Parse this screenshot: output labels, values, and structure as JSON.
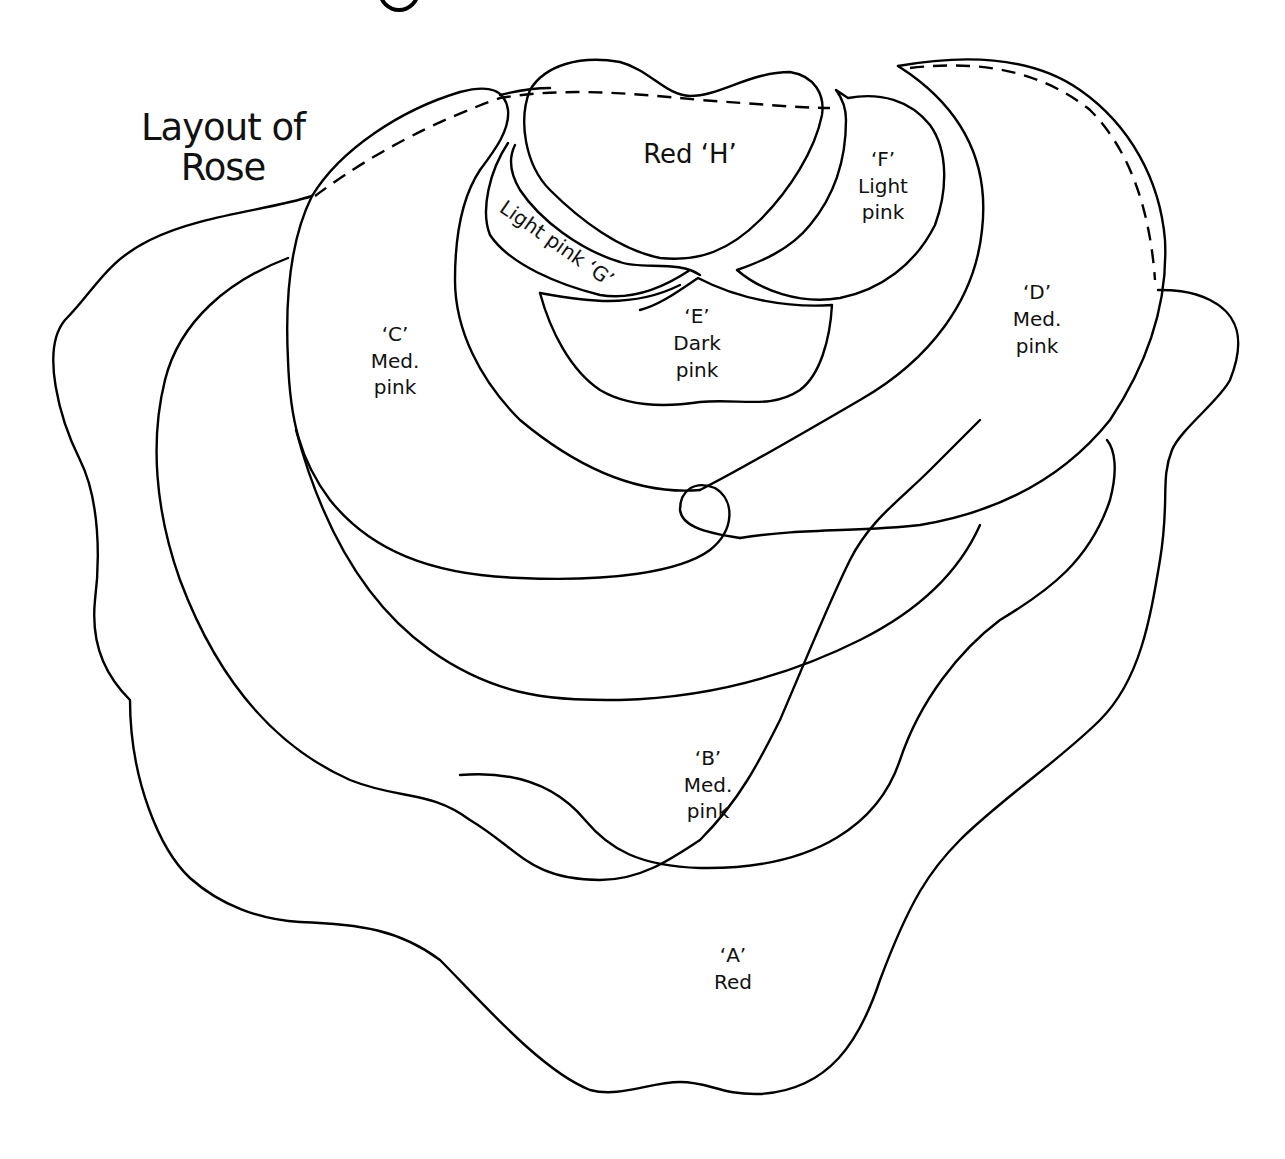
{
  "title": {
    "line1": "Layout of",
    "line2": "Rose"
  },
  "petals": [
    {
      "id": "A",
      "label_id": "‘A’",
      "color_name": "Red",
      "lines": [
        "‘A’",
        "Red"
      ]
    },
    {
      "id": "B",
      "label_id": "‘B’",
      "color_name": "Med. pink",
      "lines": [
        "‘B’",
        "Med.",
        "pink"
      ]
    },
    {
      "id": "C",
      "label_id": "‘C’",
      "color_name": "Med. pink",
      "lines": [
        "‘C’",
        "Med.",
        "pink"
      ]
    },
    {
      "id": "D",
      "label_id": "‘D’",
      "color_name": "Med. pink",
      "lines": [
        "‘D’",
        "Med.",
        "pink"
      ]
    },
    {
      "id": "E",
      "label_id": "‘E’",
      "color_name": "Dark pink",
      "lines": [
        "‘E’",
        "Dark",
        "pink"
      ]
    },
    {
      "id": "F",
      "label_id": "‘F’",
      "color_name": "Light pink",
      "lines": [
        "‘F’",
        "Light",
        "pink"
      ]
    },
    {
      "id": "G",
      "label_id": "‘G’",
      "color_name": "Light pink",
      "lines": [
        "Light pink ‘G’"
      ]
    },
    {
      "id": "H",
      "label_id": "‘H’",
      "color_name": "Red",
      "lines": [
        "Red ‘H’"
      ]
    }
  ],
  "colors": {
    "stroke": "#000000",
    "background": "#ffffff"
  }
}
